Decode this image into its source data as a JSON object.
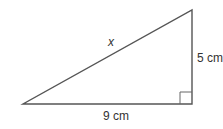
{
  "diagram": {
    "type": "right-triangle",
    "vertices": {
      "bottom_left": [
        23,
        104
      ],
      "bottom_right": [
        192,
        104
      ],
      "top_right": [
        192,
        10
      ]
    },
    "right_angle_marker": {
      "x": 180,
      "y": 92,
      "size": 12
    },
    "labels": {
      "hypotenuse": "x",
      "vertical_side": "5 cm",
      "horizontal_side": "9 cm"
    },
    "colors": {
      "stroke": "#555555",
      "text": "#333333",
      "background": "#ffffff"
    }
  }
}
